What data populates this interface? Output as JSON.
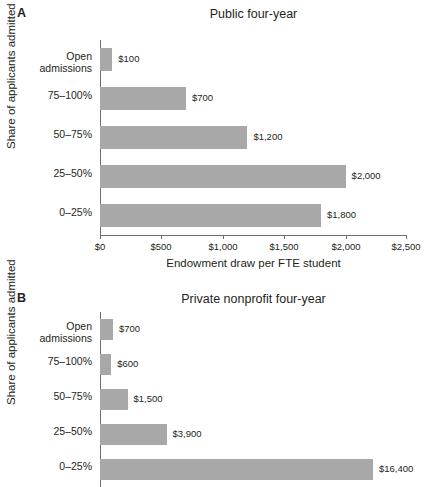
{
  "chart_data": [
    {
      "type": "bar",
      "panel": "A",
      "title": "Public four-year",
      "orientation": "horizontal",
      "categories": [
        "Open\nadmissions",
        "75–100%",
        "50–75%",
        "25–50%",
        "0–25%"
      ],
      "values": [
        100,
        700,
        1200,
        2000,
        1800
      ],
      "value_labels": [
        "$100",
        "$700",
        "$1,200",
        "$2,000",
        "$1,800"
      ],
      "xlabel": "Endowment draw per FTE student",
      "ylabel": "Share of applicants admitted",
      "xlim": [
        0,
        2500
      ],
      "xticks": [
        0,
        500,
        1000,
        1500,
        2000,
        2500
      ],
      "xtick_labels": [
        "$0",
        "$500",
        "$1,000",
        "$1,500",
        "$2,000",
        "$2,500"
      ],
      "grid": false,
      "legend": "none",
      "bar_color": "#a8a8a8"
    },
    {
      "type": "bar",
      "panel": "B",
      "title": "Private nonprofit four-year",
      "orientation": "horizontal",
      "categories": [
        "Open\nadmissions",
        "75–100%",
        "50–75%",
        "25–50%",
        "0–25%"
      ],
      "values": [
        700,
        600,
        1500,
        3900,
        16400
      ],
      "value_labels": [
        "$700",
        "$600",
        "$1,500",
        "$3,900",
        "$16,400"
      ],
      "xlabel": "",
      "ylabel": "Share of applicants admitted",
      "xlim": [
        0,
        18000
      ],
      "xticks": [],
      "xtick_labels": [],
      "grid": false,
      "legend": "none",
      "bar_color": "#a8a8a8",
      "note_cropped": "axis and last bar label clipped at image bottom edge"
    }
  ],
  "panel_a": {
    "letter": "A",
    "title": "Public four-year",
    "ylabel": "Share of applicants admitted",
    "xtitle": "Endowment draw per FTE student",
    "ticks": [
      {
        "label": "$0",
        "pos": 0
      },
      {
        "label": "$500",
        "pos": 61.4
      },
      {
        "label": "$1,000",
        "pos": 122.8
      },
      {
        "label": "$1,500",
        "pos": 184.2
      },
      {
        "label": "$2,000",
        "pos": 245.6
      },
      {
        "label": "$2,500",
        "pos": 307
      }
    ],
    "bars": [
      {
        "category": "Open\nadmissions",
        "label": "$100",
        "width": 12.3
      },
      {
        "category": "75–100%",
        "label": "$700",
        "width": 86.0
      },
      {
        "category": "50–75%",
        "label": "$1,200",
        "width": 147.4
      },
      {
        "category": "25–50%",
        "label": "$2,000",
        "width": 245.6
      },
      {
        "category": "0–25%",
        "label": "$1,800",
        "width": 221.0
      }
    ]
  },
  "panel_b": {
    "letter": "B",
    "title": "Private nonprofit four-year",
    "ylabel": "Share of applicants admitted",
    "bars": [
      {
        "category": "Open\nadmissions",
        "label": "$700",
        "width": 13.0
      },
      {
        "category": "75–100%",
        "label": "$600",
        "width": 11.2
      },
      {
        "category": "50–75%",
        "label": "$1,500",
        "width": 27.5
      },
      {
        "category": "25–50%",
        "label": "$3,900",
        "width": 66.5
      },
      {
        "category": "0–25%",
        "label": "$16,400",
        "width": 273.0
      }
    ]
  }
}
